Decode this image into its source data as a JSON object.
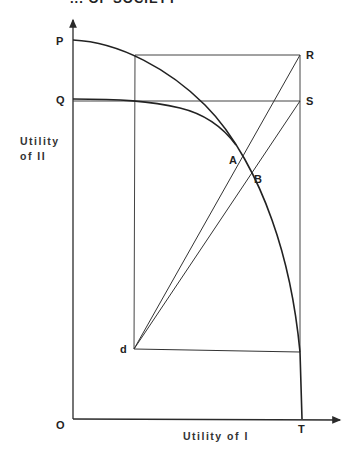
{
  "header": {
    "caption": "... OF SOCIETY"
  },
  "axes": {
    "y_label_line1": "Utility",
    "y_label_line2": "of II",
    "x_label": "Utility of I",
    "origin": "O"
  },
  "points": {
    "P": "P",
    "Q": "Q",
    "R": "R",
    "S": "S",
    "A": "A",
    "B": "B",
    "d": "d",
    "T": "T"
  },
  "colors": {
    "line": "#2a2a2a",
    "text": "#222222",
    "background": "#ffffff"
  }
}
